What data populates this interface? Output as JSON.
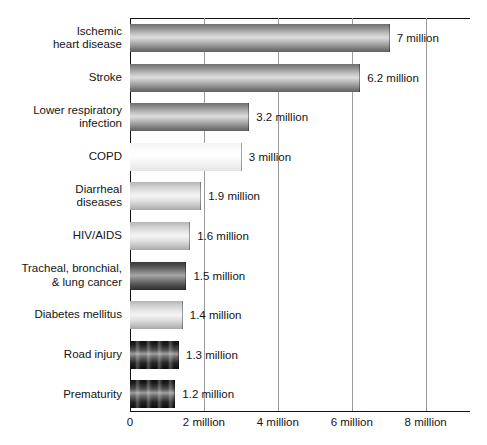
{
  "chart_data": {
    "type": "bar",
    "orientation": "horizontal",
    "title": "",
    "xlabel": "",
    "ylabel": "",
    "xlim": [
      0,
      9.2
    ],
    "grid": "vertical",
    "legend": "none",
    "categories": [
      "Ischemic\nheart disease",
      "Stroke",
      "Lower respiratory\ninfection",
      "COPD",
      "Diarrheal\ndiseases",
      "HIV/AIDS",
      "Tracheal, bronchial,\n& lung cancer",
      "Diabetes mellitus",
      "Road injury",
      "Prematurity"
    ],
    "values": [
      7,
      6.2,
      3.2,
      3,
      1.9,
      1.6,
      1.5,
      1.4,
      1.3,
      1.2
    ],
    "value_labels": [
      "7 million",
      "6.2 million",
      "3.2 million",
      "3 million",
      "1.9 million",
      "1.6 million",
      "1.5 million",
      "1.4 million",
      "1.3 million",
      "1.2 million"
    ],
    "bar_styles": [
      "g-mid",
      "g-mid",
      "g-mid",
      "g-light",
      "g-pale",
      "g-pale",
      "g-dark",
      "g-pale",
      "g-vdark",
      "g-vdark"
    ],
    "xticks": [
      0,
      2,
      4,
      6,
      8
    ],
    "xtick_labels": [
      "0",
      "2 million",
      "4 million",
      "6 million",
      "8 million"
    ],
    "units": "million deaths"
  },
  "axis": {
    "tick_color": "#9a9a9a",
    "line_color": "#111111"
  }
}
